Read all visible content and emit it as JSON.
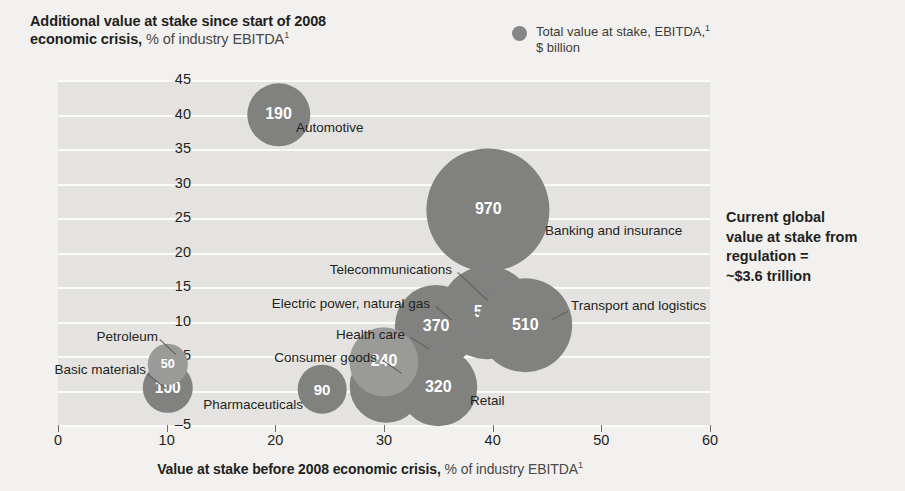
{
  "title": {
    "line1_strong": "Additional value at stake since start of 2008",
    "line2_strong": "economic crisis,",
    "line2_light": " % of industry EBITDA",
    "footnote_marker": "1"
  },
  "legend": {
    "marker": "total-value-bubble",
    "line1": "Total value at stake, EBITDA,",
    "line1_sup": "1",
    "line2": "$ billion",
    "color": "#868686"
  },
  "side_note": {
    "line1": "Current global",
    "line2": "value at stake from",
    "line3": "regulation =",
    "line4": "~$3.6 trillion"
  },
  "axes": {
    "x_caption_strong": "Value at stake before 2008 economic crisis,",
    "x_caption_light": " % of industry EBITDA",
    "x_caption_sup": "1",
    "x_ticks": [
      "0",
      "10",
      "20",
      "30",
      "40",
      "50",
      "60"
    ],
    "y_ticks": [
      "45",
      "40",
      "35",
      "30",
      "25",
      "20",
      "15",
      "10",
      "5",
      "0",
      "–5"
    ]
  },
  "chart_data": {
    "type": "scatter",
    "title": "Additional value at stake since start of 2008 economic crisis, % of industry EBITDA",
    "xlabel": "Value at stake before 2008 economic crisis, % of industry EBITDA",
    "ylabel": "Additional value at stake since start of 2008 economic crisis, % of industry EBITDA",
    "xlim": [
      0,
      60
    ],
    "ylim": [
      -5,
      45
    ],
    "grid": true,
    "legend_position": "top-right",
    "size_label": "Total value at stake, EBITDA, $ billion",
    "points": [
      {
        "name": "Automotive",
        "x": 20.3,
        "y": 40.0,
        "size": 190,
        "label": "190",
        "label_pos": "right",
        "shade": "mid"
      },
      {
        "name": "Banking and insurance",
        "x": 39.6,
        "y": 26.2,
        "size": 970,
        "label": "970",
        "label_pos": "right",
        "shade": "mid"
      },
      {
        "name": "Telecommunications",
        "x": 39.5,
        "y": 11.3,
        "size": 510,
        "label": "510",
        "label_pos": "upper-left-leader",
        "shade": "mid"
      },
      {
        "name": "Transport and logistics",
        "x": 43.0,
        "y": 9.5,
        "size": 510,
        "label": "510",
        "label_pos": "right-leader",
        "shade": "mid"
      },
      {
        "name": "Electric power, natural gas",
        "x": 34.8,
        "y": 9.3,
        "size": 370,
        "label": "370",
        "label_pos": "left-leader",
        "shade": "mid"
      },
      {
        "name": "Health care",
        "x": 30.0,
        "y": 4.2,
        "size": 240,
        "label": "240",
        "label_pos": "left-leader",
        "shade": "light"
      },
      {
        "name": "Consumer goods",
        "x": 30.2,
        "y": 0.6,
        "size": 270,
        "label": "270",
        "label_pos": "left-leader",
        "shade": "mid"
      },
      {
        "name": "Retail",
        "x": 35.0,
        "y": 0.5,
        "size": 320,
        "label": "320",
        "label_pos": "right",
        "shade": "mid"
      },
      {
        "name": "Pharmaceuticals",
        "x": 24.3,
        "y": 0.2,
        "size": 90,
        "label": "90",
        "label_pos": "left",
        "shade": "mid"
      },
      {
        "name": "Petroleum",
        "x": 10.1,
        "y": 3.8,
        "size": 50,
        "label": "50",
        "label_pos": "upper-left-leader",
        "shade": "light"
      },
      {
        "name": "Basic materials",
        "x": 10.1,
        "y": 0.4,
        "size": 100,
        "label": "100",
        "label_pos": "left-leader",
        "shade": "mid"
      }
    ]
  }
}
